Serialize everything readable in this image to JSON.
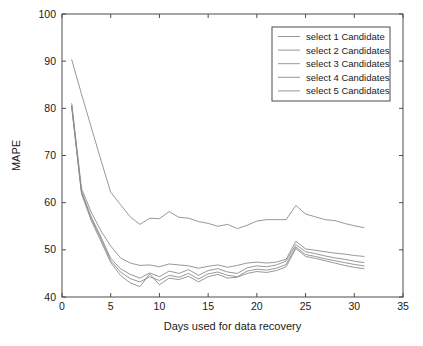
{
  "chart_data": {
    "type": "line",
    "title": "",
    "xlabel": "Days used for data recovery",
    "ylabel": "MAPE",
    "xlim": [
      0,
      35
    ],
    "ylim": [
      40,
      100
    ],
    "xticks": [
      "0",
      "5",
      "10",
      "15",
      "20",
      "25",
      "30",
      "35"
    ],
    "yticks": [
      "40",
      "50",
      "60",
      "70",
      "80",
      "90",
      "100"
    ],
    "grid": false,
    "legend_position": "top-right",
    "x": [
      1,
      2,
      3,
      4,
      5,
      6,
      7,
      8,
      9,
      10,
      11,
      12,
      13,
      14,
      15,
      16,
      17,
      18,
      19,
      20,
      21,
      22,
      23,
      24,
      25,
      26,
      27,
      28,
      29,
      30,
      31
    ],
    "series": [
      {
        "name": "select 1 Candidate",
        "color": "#8c8c8c",
        "values": [
          90.3,
          83.0,
          76.0,
          69.0,
          62.2,
          59.6,
          57.0,
          55.4,
          56.7,
          56.6,
          58.1,
          56.9,
          56.7,
          56.0,
          55.6,
          55.0,
          55.4,
          54.5,
          55.2,
          56.1,
          56.4,
          56.4,
          56.4,
          59.4,
          57.6,
          57.0,
          56.4,
          56.2,
          55.6,
          55.1,
          54.7
        ]
      },
      {
        "name": "select 2 Candidates",
        "color": "#8c8c8c",
        "values": [
          81.0,
          63.0,
          58.0,
          54.0,
          50.8,
          48.3,
          47.2,
          46.7,
          46.8,
          46.4,
          47.0,
          46.8,
          46.6,
          46.1,
          46.5,
          46.8,
          46.3,
          46.7,
          47.2,
          47.4,
          47.2,
          47.4,
          48.0,
          51.8,
          50.2,
          49.9,
          49.6,
          49.3,
          49.1,
          48.8,
          48.6
        ]
      },
      {
        "name": "select 3 Candidates",
        "color": "#8c8c8c",
        "values": [
          80.6,
          62.4,
          57.0,
          52.7,
          48.2,
          46.0,
          44.8,
          44.0,
          45.1,
          44.3,
          45.5,
          45.0,
          45.8,
          44.6,
          45.6,
          46.0,
          45.3,
          45.0,
          46.2,
          46.6,
          46.4,
          46.8,
          47.6,
          51.1,
          49.6,
          49.2,
          48.7,
          48.3,
          48.0,
          47.6,
          47.3
        ]
      },
      {
        "name": "select 4 Candidates",
        "color": "#8c8c8c",
        "values": [
          80.4,
          62.2,
          56.6,
          52.3,
          47.7,
          45.3,
          43.9,
          43.2,
          44.3,
          43.5,
          44.6,
          44.2,
          45.0,
          43.8,
          44.9,
          45.3,
          44.6,
          44.3,
          45.5,
          45.9,
          45.7,
          46.1,
          46.9,
          50.6,
          49.0,
          48.6,
          48.1,
          47.7,
          47.3,
          46.9,
          46.6
        ]
      },
      {
        "name": "select 5 Candidates",
        "color": "#8c8c8c",
        "values": [
          80.2,
          61.9,
          56.2,
          51.8,
          47.3,
          44.6,
          43.0,
          42.2,
          44.9,
          42.6,
          44.0,
          43.7,
          44.4,
          43.2,
          44.3,
          44.8,
          44.0,
          44.2,
          45.0,
          45.4,
          45.2,
          45.6,
          46.4,
          50.3,
          48.6,
          48.2,
          47.7,
          47.2,
          46.7,
          46.3,
          46.0
        ]
      }
    ]
  }
}
